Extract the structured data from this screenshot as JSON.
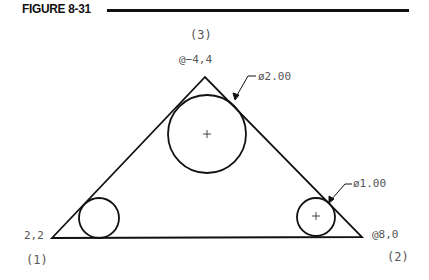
{
  "figure": {
    "title": "FIGURE 8-31"
  },
  "labels": {
    "point3": "(3)",
    "apex_coord": "@−4,4",
    "big_circle_dim": "ø2.00",
    "small_circle_dim": "ø1.00",
    "start_coord": "2,2",
    "point1": "(1)",
    "right_coord": "@8,0",
    "point2": "(2)"
  },
  "geometry": {
    "triangle": [
      [
        52,
        238
      ],
      [
        362,
        237
      ],
      [
        205,
        77
      ]
    ],
    "circles": [
      {
        "name": "big",
        "cx": 207,
        "cy": 134,
        "r": 39,
        "center_mark": true
      },
      {
        "name": "left-small",
        "cx": 99,
        "cy": 218,
        "r": 20,
        "center_mark": false
      },
      {
        "name": "right-small",
        "cx": 316,
        "cy": 217,
        "r": 19,
        "center_mark": true
      }
    ],
    "line_color": "#111111"
  }
}
